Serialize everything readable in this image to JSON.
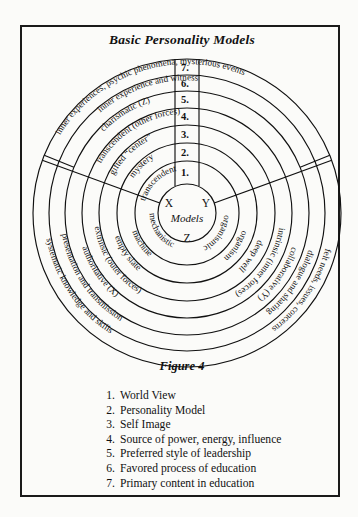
{
  "figure": {
    "title": "Basic Personality Models",
    "caption": "Figure 4"
  },
  "center": {
    "left_letter": "X",
    "right_letter": "Y",
    "bottom_letter": "Z",
    "word": "Models"
  },
  "rings": [
    {
      "index": 1,
      "number": "1.",
      "left": "mechanistic",
      "right": "organismic",
      "bottom": "transcendent"
    },
    {
      "index": 2,
      "number": "2.",
      "left": "machine",
      "right": "organism",
      "bottom": "mystery"
    },
    {
      "index": 3,
      "number": "3.",
      "left": "empty slate",
      "right": "deep well",
      "bottom": "gifted “center”"
    },
    {
      "index": 4,
      "number": "4.",
      "left": "extrinsic (outer forces)",
      "right": "intrinsic (inner forces)",
      "bottom": "transcendent (other forces)"
    },
    {
      "index": 5,
      "number": "5.",
      "left": "authoritative (X)",
      "right": "collaborative (Y)",
      "bottom": "charismatic (Z)"
    },
    {
      "index": 6,
      "number": "6.",
      "left": "presentation and transmission",
      "right": "dialogue and sharing",
      "bottom": "inner experience and witness"
    },
    {
      "index": 7,
      "number": "7.",
      "left": "systematic knowledge and skills",
      "right": "felt needs, issues, concerns",
      "bottom": "inner experiences, psychic phenomena, mysterious events"
    }
  ],
  "legend": {
    "items": [
      {
        "num": "1.",
        "text": "World View"
      },
      {
        "num": "2.",
        "text": "Personality Model"
      },
      {
        "num": "3.",
        "text": "Self Image"
      },
      {
        "num": "4.",
        "text": "Source of power, energy, influence"
      },
      {
        "num": "5.",
        "text": "Preferred style of leadership"
      },
      {
        "num": "6.",
        "text": "Favored process of education"
      },
      {
        "num": "7.",
        "text": "Primary content in education"
      }
    ]
  },
  "colors": {
    "ink": "#111111",
    "paper": "#fbfbf9"
  }
}
